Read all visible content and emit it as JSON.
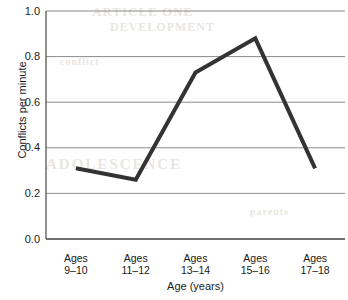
{
  "chart_data": {
    "type": "line",
    "title": "",
    "subtitle": "",
    "xlabel": "Age (years)",
    "ylabel": "Conflicts per minute",
    "categories": [
      "Ages 9–10",
      "Ages 11–12",
      "Ages 13–14",
      "Ages 15–16",
      "Ages 17–18"
    ],
    "category_lines": [
      [
        "Ages",
        "9–10"
      ],
      [
        "Ages",
        "11–12"
      ],
      [
        "Ages",
        "13–14"
      ],
      [
        "Ages",
        "15–16"
      ],
      [
        "Ages",
        "17–18"
      ]
    ],
    "values": [
      0.31,
      0.26,
      0.73,
      0.88,
      0.31
    ],
    "ylim": [
      0.0,
      1.0
    ],
    "ytick_values": [
      0.0,
      0.2,
      0.4,
      0.6,
      0.8,
      1.0
    ],
    "ytick_labels": [
      "0.0",
      "0.2",
      "0.4",
      "0.6",
      "0.8",
      "1.0"
    ],
    "grid": "horizontal",
    "legend": "none",
    "series": [
      {
        "name": "Conflicts per minute",
        "values": [
          0.31,
          0.26,
          0.73,
          0.88,
          0.31
        ]
      }
    ],
    "colors": {
      "line": "#333333",
      "grid": "#8a8a8a",
      "axis": "#555555",
      "background": "#ffffff",
      "text": "#1a1a1a"
    },
    "line_width_px": 4
  },
  "bleed_through": {
    "a": "ARTICLE ONE",
    "b": "DEVELOPMENT",
    "c": "ADOLESCENCE",
    "d": "conflict",
    "e": "parents"
  }
}
